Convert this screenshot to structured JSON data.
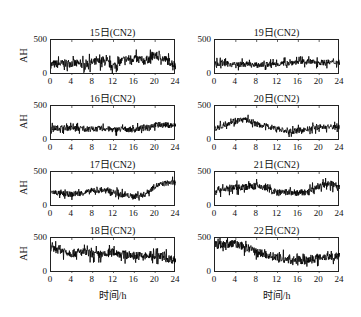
{
  "chart_data": [
    {
      "type": "line",
      "title": "15日(CN2)",
      "xlabel": "",
      "ylabel": "AH",
      "xlim": [
        0,
        24
      ],
      "ylim": [
        0,
        500
      ],
      "xticks": [
        0,
        4,
        8,
        12,
        16,
        20,
        24
      ],
      "yticks": [
        0,
        500
      ],
      "x": [
        0,
        2,
        4,
        6,
        8,
        10,
        12,
        14,
        16,
        18,
        20,
        22,
        24
      ],
      "values": [
        150,
        160,
        170,
        150,
        180,
        200,
        130,
        220,
        240,
        200,
        280,
        220,
        140
      ],
      "noise": 120
    },
    {
      "type": "line",
      "title": "16日(CN2)",
      "xlabel": "",
      "ylabel": "AH",
      "xlim": [
        0,
        24
      ],
      "ylim": [
        0,
        500
      ],
      "xticks": [
        0,
        4,
        8,
        12,
        16,
        20,
        24
      ],
      "yticks": [
        0,
        500
      ],
      "x": [
        0,
        2,
        4,
        6,
        8,
        10,
        12,
        14,
        16,
        18,
        20,
        22,
        24
      ],
      "values": [
        180,
        190,
        185,
        175,
        170,
        180,
        160,
        170,
        160,
        200,
        230,
        230,
        220
      ],
      "noise": 80
    },
    {
      "type": "line",
      "title": "17日(CN2)",
      "xlabel": "",
      "ylabel": "AH",
      "xlim": [
        0,
        24
      ],
      "ylim": [
        0,
        500
      ],
      "xticks": [
        0,
        4,
        8,
        12,
        16,
        20,
        24
      ],
      "yticks": [
        0,
        500
      ],
      "x": [
        0,
        2,
        4,
        6,
        8,
        10,
        12,
        14,
        16,
        18,
        20,
        22,
        24
      ],
      "values": [
        220,
        190,
        180,
        200,
        230,
        240,
        210,
        170,
        150,
        180,
        300,
        340,
        350
      ],
      "noise": 80
    },
    {
      "type": "line",
      "title": "18日(CN2)",
      "xlabel": "时间/h",
      "ylabel": "AH",
      "xlim": [
        0,
        24
      ],
      "ylim": [
        0,
        500
      ],
      "xticks": [
        0,
        4,
        8,
        12,
        16,
        20,
        24
      ],
      "yticks": [
        0,
        500
      ],
      "x": [
        0,
        2,
        4,
        6,
        8,
        10,
        12,
        14,
        16,
        18,
        20,
        22,
        24
      ],
      "values": [
        350,
        330,
        280,
        300,
        270,
        250,
        300,
        260,
        250,
        240,
        250,
        220,
        180
      ],
      "noise": 120
    },
    {
      "type": "line",
      "title": "19日(CN2)",
      "xlabel": "",
      "ylabel": "",
      "xlim": [
        0,
        24
      ],
      "ylim": [
        0,
        500
      ],
      "xticks": [
        0,
        4,
        8,
        12,
        16,
        20,
        24
      ],
      "yticks": [
        0,
        500
      ],
      "x": [
        0,
        2,
        4,
        6,
        8,
        10,
        12,
        14,
        16,
        18,
        20,
        22,
        24
      ],
      "values": [
        170,
        160,
        150,
        155,
        140,
        150,
        160,
        170,
        190,
        190,
        180,
        180,
        180
      ],
      "noise": 80
    },
    {
      "type": "line",
      "title": "20日(CN2)",
      "xlabel": "",
      "ylabel": "",
      "xlim": [
        0,
        24
      ],
      "ylim": [
        0,
        500
      ],
      "xticks": [
        0,
        4,
        8,
        12,
        16,
        20,
        24
      ],
      "yticks": [
        0,
        500
      ],
      "x": [
        0,
        2,
        4,
        6,
        8,
        10,
        12,
        14,
        16,
        18,
        20,
        22,
        24
      ],
      "values": [
        170,
        240,
        300,
        300,
        240,
        210,
        180,
        130,
        150,
        170,
        200,
        200,
        200
      ],
      "noise": 80
    },
    {
      "type": "line",
      "title": "21日(CN2)",
      "xlabel": "",
      "ylabel": "",
      "xlim": [
        0,
        24
      ],
      "ylim": [
        0,
        500
      ],
      "xticks": [
        0,
        4,
        8,
        12,
        16,
        20,
        24
      ],
      "yticks": [
        0,
        500
      ],
      "x": [
        0,
        2,
        4,
        6,
        8,
        10,
        12,
        14,
        16,
        18,
        20,
        22,
        24
      ],
      "values": [
        240,
        260,
        280,
        290,
        300,
        270,
        200,
        210,
        200,
        210,
        300,
        330,
        300
      ],
      "noise": 100
    },
    {
      "type": "line",
      "title": "22日(CN2)",
      "xlabel": "时间/h",
      "ylabel": "",
      "xlim": [
        0,
        24
      ],
      "ylim": [
        0,
        500
      ],
      "xticks": [
        0,
        4,
        8,
        12,
        16,
        20,
        24
      ],
      "yticks": [
        0,
        500
      ],
      "x": [
        0,
        2,
        4,
        6,
        8,
        10,
        12,
        14,
        16,
        18,
        20,
        22,
        24
      ],
      "values": [
        400,
        410,
        420,
        360,
        300,
        260,
        220,
        190,
        180,
        180,
        230,
        240,
        230
      ],
      "noise": 120
    }
  ]
}
